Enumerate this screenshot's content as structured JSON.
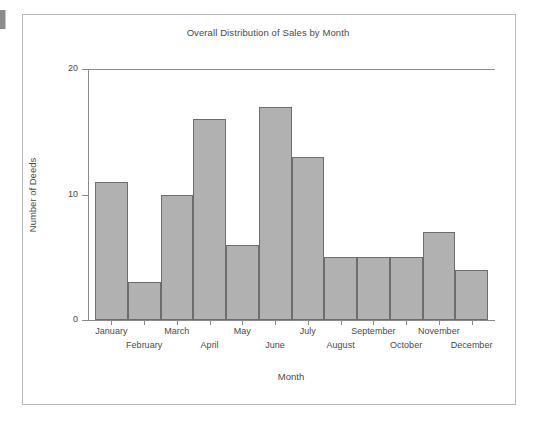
{
  "chart_data": {
    "type": "bar",
    "title": "Overall Distribution of Sales by Month",
    "xlabel": "Month",
    "ylabel": "Number of Deeds",
    "categories": [
      "January",
      "February",
      "March",
      "April",
      "May",
      "June",
      "July",
      "August",
      "September",
      "October",
      "November",
      "December"
    ],
    "values": [
      11,
      3,
      10,
      16,
      6,
      17,
      13,
      5,
      5,
      5,
      7,
      4
    ],
    "ylim": [
      0,
      20
    ],
    "yticks": [
      0,
      10,
      20
    ],
    "ytick_labels": [
      "0",
      "10",
      "20"
    ],
    "grid": false,
    "legend": null,
    "bar_color": "#b1b1b1",
    "bar_edge_color": "#6d6d6d",
    "axis_color": "#8b8b8b",
    "text_color": "#4a4a4a",
    "frame_color": "#b9b9b9",
    "background": "#ffffff",
    "xtick_label_rows": [
      {
        "row": "upper",
        "labels": [
          "January",
          "March",
          "May",
          "July",
          "September",
          "November"
        ]
      },
      {
        "row": "lower",
        "labels": [
          "February",
          "April",
          "June",
          "August",
          "October",
          "December"
        ]
      }
    ]
  }
}
